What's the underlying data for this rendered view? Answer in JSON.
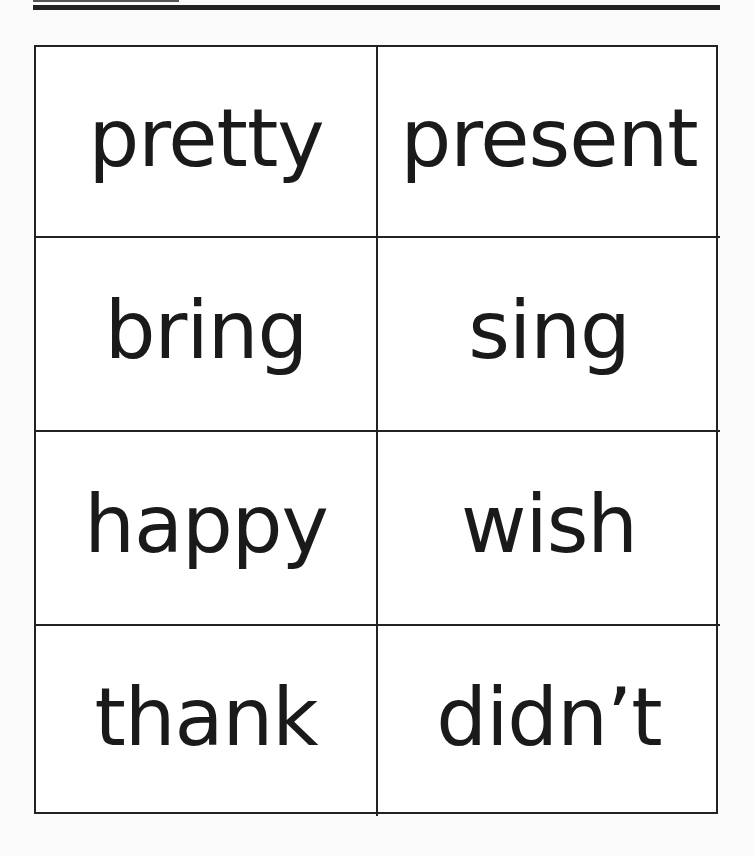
{
  "worksheet": {
    "type": "sight-word flash cards",
    "columns": 2,
    "rows": 4,
    "cards": [
      {
        "word": "pretty"
      },
      {
        "word": "present"
      },
      {
        "word": "bring"
      },
      {
        "word": "sing"
      },
      {
        "word": "happy"
      },
      {
        "word": "wish"
      },
      {
        "word": "thank"
      },
      {
        "word": "didn’t"
      }
    ]
  },
  "colors": {
    "ink": "#1a1a1a",
    "paper": "#ffffff",
    "border": "#222222"
  }
}
